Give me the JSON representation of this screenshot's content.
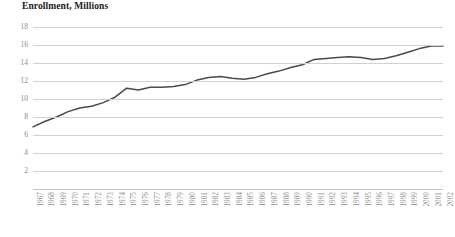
{
  "chart_data": {
    "type": "line",
    "title": "Enrollment, Millions",
    "xlabel": "",
    "ylabel": "",
    "ylim": [
      0,
      18
    ],
    "yticks": [
      18,
      16,
      14,
      12,
      10,
      8,
      6,
      4,
      2
    ],
    "grid": true,
    "legend": "none",
    "line_color": "#4a4a4a",
    "grid_color": "#d2d2d2",
    "categories": [
      "1967",
      "1968",
      "1969",
      "1970",
      "1971",
      "1972",
      "1973",
      "1974",
      "1975",
      "1976",
      "1977",
      "1978",
      "1979",
      "1980",
      "1981",
      "1982",
      "1983",
      "1984",
      "1985",
      "1986",
      "1987",
      "1988",
      "1989",
      "1990",
      "1991",
      "1992",
      "1993",
      "1994",
      "1995",
      "1996",
      "1997",
      "1998",
      "1999",
      "2000",
      "2001",
      "2002"
    ],
    "values": [
      6.9,
      7.5,
      8.0,
      8.6,
      9.0,
      9.2,
      9.6,
      10.2,
      11.2,
      11.0,
      11.3,
      11.3,
      11.4,
      11.6,
      12.1,
      12.4,
      12.5,
      12.3,
      12.2,
      12.4,
      12.8,
      13.1,
      13.5,
      13.8,
      14.4,
      14.5,
      14.6,
      14.7,
      14.6,
      14.4,
      14.5,
      14.8,
      15.2,
      15.6,
      15.9,
      15.9
    ],
    "series": [
      {
        "name": "Enrollment",
        "values": [
          6.9,
          7.5,
          8.0,
          8.6,
          9.0,
          9.2,
          9.6,
          10.2,
          11.2,
          11.0,
          11.3,
          11.3,
          11.4,
          11.6,
          12.1,
          12.4,
          12.5,
          12.3,
          12.2,
          12.4,
          12.8,
          13.1,
          13.5,
          13.8,
          14.4,
          14.5,
          14.6,
          14.7,
          14.6,
          14.4,
          14.5,
          14.8,
          15.2,
          15.6,
          15.9,
          15.9
        ]
      }
    ]
  }
}
